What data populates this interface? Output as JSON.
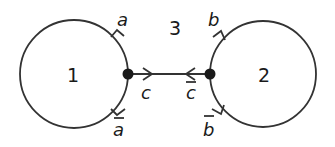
{
  "diagram": {
    "regions": [
      {
        "id": "region-1",
        "label": "1"
      },
      {
        "id": "region-2",
        "label": "2"
      },
      {
        "id": "region-3",
        "label": "3"
      }
    ],
    "edges": [
      {
        "id": "edge-a",
        "label": "a",
        "overline": false
      },
      {
        "id": "edge-a-bar",
        "label": "a",
        "overline": true
      },
      {
        "id": "edge-c",
        "label": "c",
        "overline": false
      },
      {
        "id": "edge-c-bar",
        "label": "c",
        "overline": true
      },
      {
        "id": "edge-b",
        "label": "b",
        "overline": false
      },
      {
        "id": "edge-b-bar",
        "label": "b",
        "overline": true
      }
    ],
    "colors": {
      "stroke": "#333333",
      "vertex": "#1a1a1a",
      "background": "#ffffff"
    }
  }
}
